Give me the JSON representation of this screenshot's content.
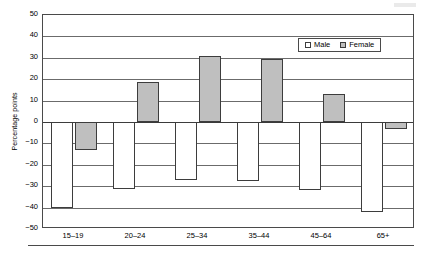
{
  "chart_data": {
    "type": "bar",
    "title": "",
    "subtitle": "",
    "xlabel": "",
    "ylabel": "Percentage points",
    "categories": [
      "15–19",
      "20–24",
      "25–34",
      "35–44",
      "45–64",
      "65+"
    ],
    "series": [
      {
        "name": "Male",
        "color": "#ffffff",
        "values": [
          -40.3,
          -31.2,
          -27.0,
          -27.5,
          -32.0,
          -42.0
        ]
      },
      {
        "name": "Female",
        "color": "#bfbfbf",
        "values": [
          -13.2,
          18.8,
          30.7,
          29.3,
          13.0,
          -3.5
        ]
      }
    ],
    "ylim": [
      -50,
      50
    ],
    "yticks": [
      50,
      40,
      30,
      20,
      10,
      0,
      -10,
      -20,
      -30,
      -40,
      -50
    ],
    "ytick_labels": [
      "50",
      "40",
      "30",
      "20",
      "10",
      "0",
      "−10",
      "−20",
      "−30",
      "−40",
      "−50"
    ],
    "grid": true,
    "grid_axis": "y",
    "legend_position": "top-right-inside",
    "legend": [
      "Male",
      "Female"
    ],
    "zero_line": true,
    "bar_outline_color": "#3d3d3d",
    "plot_border_color": "#4a4a4a"
  },
  "legend": {
    "male_label": "Male",
    "female_label": "Female"
  },
  "axes": {
    "y_title": "Percentage points"
  }
}
